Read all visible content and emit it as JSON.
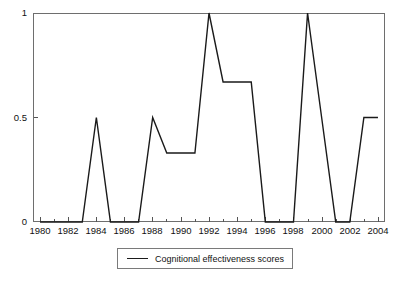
{
  "chart_data": {
    "type": "line",
    "title": "",
    "subtitle": "",
    "xlabel": "",
    "ylabel": "",
    "xlim": [
      1979.5,
      2004.5
    ],
    "ylim": [
      0,
      1
    ],
    "grid": false,
    "legend_position": "bottom-center",
    "x_tick_labels": [
      "1980",
      "1982",
      "1984",
      "1986",
      "1988",
      "1990",
      "1992",
      "1994",
      "1996",
      "1998",
      "2000",
      "2002",
      "2004"
    ],
    "x_tick_values": [
      1980,
      1982,
      1984,
      1986,
      1988,
      1990,
      1992,
      1994,
      1996,
      1998,
      2000,
      2002,
      2004
    ],
    "x_minor_tick_values": [
      1981,
      1983,
      1985,
      1987,
      1989,
      1991,
      1993,
      1995,
      1997,
      1999,
      2001,
      2003
    ],
    "y_tick_labels": [
      "0",
      "0.5",
      "1"
    ],
    "y_tick_values": [
      0,
      0.5,
      1
    ],
    "series": [
      {
        "name": "Cognitional effectiveness scores",
        "color": "#1a1a1a",
        "line_width": 1.4,
        "x": [
          1980,
          1981,
          1982,
          1983,
          1984,
          1985,
          1986,
          1987,
          1988,
          1989,
          1990,
          1991,
          1992,
          1993,
          1994,
          1995,
          1996,
          1997,
          1998,
          1999,
          2000,
          2001,
          2002,
          2003,
          2004
        ],
        "values": [
          0,
          0,
          0,
          0,
          0.5,
          0,
          0,
          0,
          0.5,
          0.33,
          0.33,
          0.33,
          1,
          0.67,
          0.67,
          0.67,
          0,
          0,
          0,
          1,
          0.5,
          0,
          0,
          0.5,
          0.5
        ]
      }
    ]
  },
  "legend": {
    "entries": [
      {
        "label": "Cognitional effectiveness scores",
        "marker": "line-swatch"
      }
    ]
  },
  "axes": {
    "frame_color": "#6e6e6e",
    "tick_color": "#555555"
  },
  "artifacts": {
    "caption_fragment": "",
    "yaxis_fragment": ""
  }
}
